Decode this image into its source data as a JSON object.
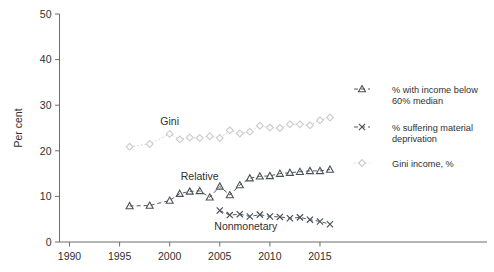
{
  "chart_data": {
    "type": "line",
    "title": "",
    "subtitle": "",
    "xlabel": "",
    "ylabel": "Per cent",
    "xlim": [
      1989,
      2017.5
    ],
    "ylim": [
      0,
      50
    ],
    "yticks": [
      0,
      10,
      20,
      30,
      40,
      50
    ],
    "xticks": [
      1990,
      1995,
      2000,
      2005,
      2010,
      2015
    ],
    "grid": false,
    "legend_position": "right",
    "series": [
      {
        "name": "% with income below 60% median",
        "inline_label": "Relative",
        "marker": "triangle",
        "linestyle": "dashed",
        "color": "#4b5158",
        "x": [
          1996,
          1998,
          2000,
          2001,
          2002,
          2003,
          2004,
          2005,
          2006,
          2007,
          2008,
          2009,
          2010,
          2011,
          2012,
          2013,
          2014,
          2015,
          2016
        ],
        "y": [
          7.9,
          8.0,
          9.1,
          10.6,
          11.1,
          11.2,
          9.8,
          12.2,
          10.3,
          12.5,
          14.0,
          14.4,
          14.5,
          15.0,
          15.2,
          15.4,
          15.6,
          15.6,
          15.9
        ]
      },
      {
        "name": "% suffering material deprivation",
        "inline_label": "Nonmonetary",
        "marker": "x",
        "linestyle": "dashed",
        "color": "#4b5158",
        "x": [
          2005,
          2006,
          2007,
          2008,
          2009,
          2010,
          2011,
          2012,
          2013,
          2014,
          2015,
          2016
        ],
        "y": [
          6.9,
          5.9,
          6.1,
          5.6,
          6.0,
          5.6,
          5.5,
          5.2,
          5.4,
          4.9,
          4.5,
          3.9
        ]
      },
      {
        "name": "Gini income, %",
        "inline_label": "Gini",
        "marker": "diamond",
        "linestyle": "dotted",
        "color": "#cbcbd0",
        "x": [
          1996,
          1998,
          2000,
          2001,
          2002,
          2003,
          2004,
          2005,
          2006,
          2007,
          2008,
          2009,
          2010,
          2011,
          2012,
          2013,
          2014,
          2015,
          2016
        ],
        "y": [
          20.9,
          21.5,
          23.7,
          22.5,
          22.9,
          22.8,
          23.2,
          22.8,
          24.5,
          23.8,
          24.2,
          25.5,
          25.1,
          25.0,
          25.8,
          25.8,
          25.6,
          26.7,
          27.3
        ]
      }
    ]
  },
  "legend": {
    "entries": [
      {
        "label_line1": "% with income below",
        "label_line2": "60% median",
        "marker": "triangle-marker"
      },
      {
        "label_line1": "% suffering material",
        "label_line2": "deprivation",
        "marker": "x-marker"
      },
      {
        "label_line1": "Gini income, %",
        "label_line2": "",
        "marker": "diamond-marker"
      }
    ]
  },
  "axes": {
    "y_title": "Per cent",
    "y_tick_labels": [
      "0",
      "10",
      "20",
      "30",
      "40",
      "50"
    ],
    "x_tick_labels": [
      "1990",
      "1995",
      "2000",
      "2005",
      "2010",
      "2015"
    ]
  },
  "inline_labels": {
    "gini": "Gini",
    "relative": "Relative",
    "nonmonetary": "Nonmonetary"
  }
}
